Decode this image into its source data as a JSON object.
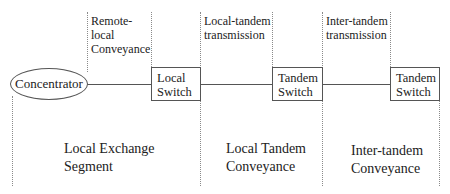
{
  "diagram": {
    "nodes": {
      "concentrator": "Concentrator",
      "local_switch": [
        "Local",
        "Switch"
      ],
      "tandem_switch_1": [
        "Tandem",
        "Switch"
      ],
      "tandem_switch_2": [
        "Tandem",
        "Switch"
      ]
    },
    "link_labels": {
      "remote_local": [
        "Remote-",
        "local",
        "Conveyance"
      ],
      "local_tandem": [
        "Local-tandem",
        "transmission"
      ],
      "inter_tandem": [
        "Inter-tandem",
        "transmission"
      ]
    },
    "segments": {
      "local_exchange": [
        "Local Exchange",
        "Segment"
      ],
      "local_tandem": [
        "Local Tandem",
        "Conveyance"
      ],
      "inter_tandem": [
        "Inter-tandem",
        "Conveyance"
      ]
    }
  }
}
